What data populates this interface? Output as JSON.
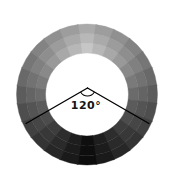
{
  "figure": {
    "background": "#ffffff",
    "ring": {
      "center": {
        "x": 87,
        "y": 94.5
      },
      "outer_radius": 70.5,
      "inner_radius": 41.5,
      "band_radii": [
        41.5,
        51.5,
        61,
        70.5
      ],
      "segments": [
        {
          "start": -7.5,
          "end": 7.5,
          "colors": [
            "#c6c6c6",
            "#b8b8b8",
            "#aaaaaa"
          ]
        },
        {
          "start": 7.5,
          "end": 22.5,
          "colors": [
            "#b7b7b7",
            "#aaaaaa",
            "#9d9d9d"
          ]
        },
        {
          "start": 22.5,
          "end": 37.5,
          "colors": [
            "#a8a8a8",
            "#9c9c9c",
            "#909090"
          ]
        },
        {
          "start": 37.5,
          "end": 52.5,
          "colors": [
            "#999999",
            "#8e8e8e",
            "#838383"
          ]
        },
        {
          "start": 52.5,
          "end": 67.5,
          "colors": [
            "#898989",
            "#808080",
            "#767676"
          ]
        },
        {
          "start": 67.5,
          "end": 82.5,
          "colors": [
            "#7a7a7a",
            "#727272",
            "#696969"
          ]
        },
        {
          "start": 82.5,
          "end": 97.5,
          "colors": [
            "#6b6b6b",
            "#646464",
            "#5c5c5c"
          ]
        },
        {
          "start": 97.5,
          "end": 112.5,
          "colors": [
            "#5b5b5b",
            "#545454",
            "#4e4e4e"
          ]
        },
        {
          "start": 112.5,
          "end": 127.5,
          "colors": [
            "#4c4c4c",
            "#464646",
            "#414141"
          ]
        },
        {
          "start": 127.5,
          "end": 142.5,
          "colors": [
            "#3d3d3d",
            "#383838",
            "#343434"
          ]
        },
        {
          "start": 142.5,
          "end": 157.5,
          "colors": [
            "#2d2d2d",
            "#2a2a2a",
            "#272727"
          ]
        },
        {
          "start": 157.5,
          "end": 172.5,
          "colors": [
            "#1e1e1e",
            "#1c1c1c",
            "#1a1a1a"
          ]
        },
        {
          "start": 172.5,
          "end": 187.5,
          "colors": [
            "#0f0f0f",
            "#0e0e0e",
            "#0d0d0d"
          ]
        },
        {
          "start": 187.5,
          "end": 202.5,
          "colors": [
            "#1e1e1e",
            "#1c1c1c",
            "#1a1a1a"
          ]
        },
        {
          "start": 202.5,
          "end": 217.5,
          "colors": [
            "#2d2d2d",
            "#2a2a2a",
            "#272727"
          ]
        },
        {
          "start": 217.5,
          "end": 232.5,
          "colors": [
            "#3d3d3d",
            "#383838",
            "#343434"
          ]
        },
        {
          "start": 232.5,
          "end": 247.5,
          "colors": [
            "#4c4c4c",
            "#464646",
            "#414141"
          ]
        },
        {
          "start": 247.5,
          "end": 262.5,
          "colors": [
            "#5b5b5b",
            "#545454",
            "#4e4e4e"
          ]
        },
        {
          "start": 262.5,
          "end": 277.5,
          "colors": [
            "#6b6b6b",
            "#646464",
            "#5c5c5c"
          ]
        },
        {
          "start": 277.5,
          "end": 292.5,
          "colors": [
            "#7a7a7a",
            "#727272",
            "#696969"
          ]
        },
        {
          "start": 292.5,
          "end": 307.5,
          "colors": [
            "#898989",
            "#808080",
            "#767676"
          ]
        },
        {
          "start": 307.5,
          "end": 322.5,
          "colors": [
            "#999999",
            "#8e8e8e",
            "#838383"
          ]
        },
        {
          "start": 322.5,
          "end": 337.5,
          "colors": [
            "#a8a8a8",
            "#9c9c9c",
            "#909090"
          ]
        },
        {
          "start": 337.5,
          "end": 352.5,
          "colors": [
            "#b7b7b7",
            "#aaaaaa",
            "#9d9d9d"
          ]
        }
      ]
    },
    "angle_marker": {
      "label": "120°",
      "angle_deg": 120,
      "color": "#000000",
      "vertex": {
        "x": 87.5,
        "y": 88
      },
      "ray_endpoints": [
        {
          "x": 26,
          "y": 123.5
        },
        {
          "x": 149,
          "y": 123.5
        }
      ],
      "arc_radius": 8,
      "label_x": 86,
      "label_y": 109
    }
  }
}
